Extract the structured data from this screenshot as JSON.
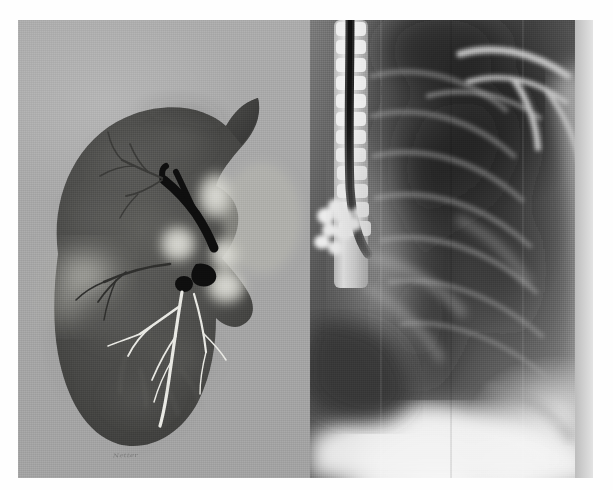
{
  "figure": {
    "kind": "medical-illustration-and-radiograph-composite",
    "caption": "",
    "background_color": "#ffffff",
    "plate_background_color": "#a9a9a9",
    "width_px": 613,
    "height_px": 490
  },
  "panels": {
    "left": {
      "name": "anatomical-lung-illustration",
      "label": "",
      "background_color": "#a8a8a8",
      "subject": "right lung, mediastinal (medial) surface",
      "signature_text": "Netter",
      "structures": [
        {
          "name": "lung-parenchyma",
          "tone": "#4f4f4f"
        },
        {
          "name": "lung-apex",
          "tone": "#3c3c3c"
        },
        {
          "name": "bronchus-principal",
          "tone": "#141414"
        },
        {
          "name": "bronchus-upper-lobe",
          "tone": "#141414"
        },
        {
          "name": "pulmonary-artery",
          "tone": "#c8c8c4"
        },
        {
          "name": "pulmonary-vein-superior",
          "tone": "#cfcfc9"
        },
        {
          "name": "pulmonary-vein-inferior",
          "tone": "#cfcfc9"
        },
        {
          "name": "vessel-branch-tree",
          "tone": "#e6e6e2"
        },
        {
          "name": "oblique-fissure",
          "tone": "#9a9a94"
        },
        {
          "name": "hilum",
          "tone": "#b8b8b2"
        }
      ]
    },
    "right": {
      "name": "chest-radiograph",
      "label": "",
      "background_color": "#585858",
      "subject": "lateral / oblique chest X-ray",
      "structures": [
        {
          "name": "thoracic-spine",
          "tone": "#e9e9e9"
        },
        {
          "name": "trachea-air-column",
          "tone": "#1b1b1b"
        },
        {
          "name": "vertebral-bodies",
          "tone": "#dedede"
        },
        {
          "name": "posterior-ribs",
          "tone": "#8d8d8d"
        },
        {
          "name": "clavicle",
          "tone": "#d8d8d8"
        },
        {
          "name": "scapula-border",
          "tone": "#c2c2c2"
        },
        {
          "name": "lung-field",
          "tone": "#343434"
        },
        {
          "name": "hilar-vessels",
          "tone": "#9a9a9a"
        },
        {
          "name": "cardiac-silhouette",
          "tone": "#6f6f6f"
        },
        {
          "name": "hemidiaphragm",
          "tone": "#f2f2f2"
        },
        {
          "name": "costophrenic-angle",
          "tone": "#d5d5d5"
        },
        {
          "name": "soft-tissue-shadow",
          "tone": "#a5a5a5"
        }
      ]
    }
  },
  "palette": {
    "page_white": "#ffffff",
    "plate_gray": "#a9a9a9",
    "illustration_tissue": "#4f4f4f",
    "illustration_highlight": "#d8d8d2",
    "bronchus_black": "#101010",
    "xray_dark_lung": "#2e2e2e",
    "xray_bone_white": "#ededed",
    "xray_diaphragm_white": "#f6f6f6",
    "margin_strip": "#d2d2d2"
  }
}
